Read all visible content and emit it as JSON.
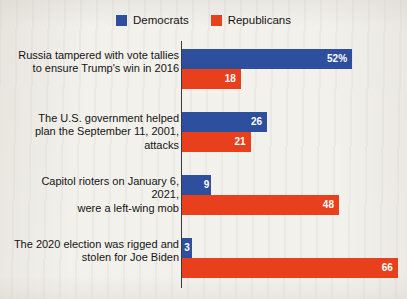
{
  "legend": {
    "position": "top-center",
    "entries": [
      {
        "label": "Democrats",
        "color": "#2E4E9E",
        "icon": "square-swatch"
      },
      {
        "label": "Republicans",
        "color": "#E8401C",
        "icon": "square-swatch"
      }
    ]
  },
  "chart_data": {
    "type": "bar",
    "orientation": "horizontal",
    "title": "",
    "subtitle": "",
    "xlabel": "",
    "ylabel": "",
    "grid": false,
    "legend_position": "top-center",
    "xlim": [
      0,
      70
    ],
    "value_suffix_first_bar": "%",
    "categories": [
      "Russia tampered with vote tallies to ensure Trump's win in 2016",
      "The U.S. government helped plan the September 11, 2001, attacks",
      "Capitol rioters on January 6, 2021, were a left-wing mob",
      "The 2020 election was rigged and stolen for Joe Biden"
    ],
    "category_lines": [
      [
        "Russia tampered with vote tallies",
        "to ensure Trump's win in 2016"
      ],
      [
        "The U.S. government helped",
        "plan the September 11, 2001, attacks"
      ],
      [
        "Capitol rioters on January 6, 2021,",
        "were a left-wing mob"
      ],
      [
        "The 2020 election was rigged and",
        "stolen for Joe Biden"
      ]
    ],
    "series": [
      {
        "name": "Democrats",
        "color": "#2E4E9E",
        "values": [
          52,
          26,
          9,
          3
        ]
      },
      {
        "name": "Republicans",
        "color": "#E8401C",
        "values": [
          18,
          21,
          48,
          66
        ]
      }
    ],
    "data_labels": [
      {
        "democrats": "52%",
        "republicans": "18"
      },
      {
        "democrats": "26",
        "republicans": "21"
      },
      {
        "democrats": "9",
        "republicans": "48"
      },
      {
        "democrats": "3",
        "republicans": "66"
      }
    ]
  }
}
